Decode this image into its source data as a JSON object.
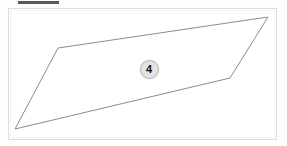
{
  "canvas": {
    "width": 287,
    "height": 146,
    "background_color": "#fdfdfd"
  },
  "top_bar_stub": {
    "name": "cropped-toolbar-strip",
    "color": "#585858"
  },
  "frame": {
    "name": "drawing-canvas-frame",
    "border_color": "#dcdcdc",
    "fill_color": "#ffffff"
  },
  "shape": {
    "name": "region-polygon",
    "type": "polygon",
    "stroke_color": "#8c8c8c",
    "fill_color": "#ffffff",
    "stroke_width": 1,
    "points": "58,48 268,17 230,78 15,129",
    "vertices": [
      {
        "x": 58,
        "y": 48
      },
      {
        "x": 268,
        "y": 17
      },
      {
        "x": 230,
        "y": 78
      },
      {
        "x": 15,
        "y": 129
      }
    ]
  },
  "badge": {
    "name": "region-number-badge",
    "label": "4",
    "center_x": 149,
    "center_y": 69,
    "diameter": 19,
    "fill_color": "#e3e3e3",
    "ring_color": "#b4b4b4",
    "text_color": "#111111"
  }
}
